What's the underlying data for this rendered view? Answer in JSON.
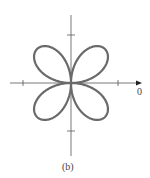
{
  "figure": {
    "caption": "(b)",
    "axis_label_zero": "0",
    "curve": "four-petal rose",
    "colors": {
      "curve": "#6a6a6a",
      "axis": "#555555"
    }
  }
}
